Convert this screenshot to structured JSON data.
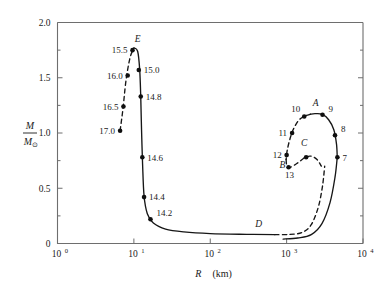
{
  "figure": {
    "kind": "mass-radius-diagram",
    "background": "#ffffff",
    "ink_color": "#161616",
    "axis_color": "#6e6e6e"
  },
  "axes": {
    "y_label_numerator": "M",
    "y_label_denominator": "M",
    "y_label_denominator_sub": "⊙",
    "x_label_symbol": "R",
    "x_label_units": "(km)",
    "y_ticks": [
      "0",
      "0.5",
      "1.0",
      "1.5",
      "2.0"
    ],
    "y_tick_values": [
      0,
      0.5,
      1.0,
      1.5,
      2.0
    ],
    "y_minor_tick_values": [
      0.25,
      0.75,
      1.25,
      1.75
    ],
    "x_ticks": [
      {
        "mantissa": "10",
        "exponent": "0"
      },
      {
        "mantissa": "10",
        "exponent": "1"
      },
      {
        "mantissa": "10",
        "exponent": "2"
      },
      {
        "mantissa": "10",
        "exponent": "3"
      },
      {
        "mantissa": "10",
        "exponent": "4"
      }
    ],
    "x_tick_values": [
      1,
      10,
      100,
      1000,
      10000
    ]
  },
  "chart_data": {
    "type": "line",
    "title": "",
    "xlabel": "R (km)",
    "ylabel": "M / M⊙",
    "xscale": "log",
    "yscale": "linear",
    "xlim": [
      1,
      10000
    ],
    "ylim": [
      0,
      2.0
    ],
    "grid": false,
    "legend": null,
    "series": [
      {
        "name": "white-dwarf-branch-unstable",
        "style": "dashed",
        "points": [
          {
            "x": 6.6,
            "y": 1.02
          },
          {
            "x": 7.2,
            "y": 1.22
          },
          {
            "x": 7.9,
            "y": 1.48
          },
          {
            "x": 8.9,
            "y": 1.68
          },
          {
            "x": 10.0,
            "y": 1.77
          }
        ]
      },
      {
        "name": "white-dwarf-branch-stable",
        "style": "solid",
        "points": [
          {
            "x": 10.0,
            "y": 1.77
          },
          {
            "x": 11.2,
            "y": 1.74
          },
          {
            "x": 11.9,
            "y": 1.58
          },
          {
            "x": 12.3,
            "y": 1.33
          },
          {
            "x": 12.6,
            "y": 1.03
          },
          {
            "x": 13.0,
            "y": 0.72
          },
          {
            "x": 13.6,
            "y": 0.43
          },
          {
            "x": 15.0,
            "y": 0.27
          },
          {
            "x": 18.0,
            "y": 0.185
          },
          {
            "x": 26.0,
            "y": 0.13
          },
          {
            "x": 45.0,
            "y": 0.105
          },
          {
            "x": 100.0,
            "y": 0.09
          },
          {
            "x": 300.0,
            "y": 0.083
          },
          {
            "x": 700.0,
            "y": 0.08
          }
        ]
      },
      {
        "name": "lower-dashed-branch-D",
        "style": "dashed",
        "points": [
          {
            "x": 700.0,
            "y": 0.08
          },
          {
            "x": 1100.0,
            "y": 0.082
          },
          {
            "x": 1600.0,
            "y": 0.1
          },
          {
            "x": 2100.0,
            "y": 0.17
          },
          {
            "x": 2600.0,
            "y": 0.33
          },
          {
            "x": 2950.0,
            "y": 0.52
          },
          {
            "x": 3150.0,
            "y": 0.7
          }
        ]
      },
      {
        "name": "lower-solid-branch-to-7",
        "style": "solid",
        "points": [
          {
            "x": 900.0,
            "y": 0.04
          },
          {
            "x": 1400.0,
            "y": 0.05
          },
          {
            "x": 2100.0,
            "y": 0.08
          },
          {
            "x": 2900.0,
            "y": 0.18
          },
          {
            "x": 3700.0,
            "y": 0.37
          },
          {
            "x": 4300.0,
            "y": 0.6
          },
          {
            "x": 4600.0,
            "y": 0.78
          }
        ]
      },
      {
        "name": "upper-solid-branch-7-8-9",
        "style": "solid",
        "points": [
          {
            "x": 4600.0,
            "y": 0.78
          },
          {
            "x": 4500.0,
            "y": 0.9
          },
          {
            "x": 4150.0,
            "y": 1.03
          },
          {
            "x": 3550.0,
            "y": 1.12
          },
          {
            "x": 2900.0,
            "y": 1.17
          },
          {
            "x": 2350.0,
            "y": 1.175
          },
          {
            "x": 2050.0,
            "y": 1.17
          }
        ]
      },
      {
        "name": "upper-dashed-branch-A-10-11-12",
        "style": "dashed",
        "points": [
          {
            "x": 2050.0,
            "y": 1.17
          },
          {
            "x": 1700.0,
            "y": 1.15
          },
          {
            "x": 1420.0,
            "y": 1.11
          },
          {
            "x": 1200.0,
            "y": 1.02
          },
          {
            "x": 1080.0,
            "y": 0.92
          },
          {
            "x": 1010.0,
            "y": 0.83
          },
          {
            "x": 985.0,
            "y": 0.76
          }
        ]
      },
      {
        "name": "inner-dashed-branch-B-13-C",
        "style": "dashed",
        "points": [
          {
            "x": 985.0,
            "y": 0.76
          },
          {
            "x": 1010.0,
            "y": 0.7
          },
          {
            "x": 1120.0,
            "y": 0.69
          },
          {
            "x": 1400.0,
            "y": 0.73
          },
          {
            "x": 1750.0,
            "y": 0.78
          },
          {
            "x": 2100.0,
            "y": 0.79
          },
          {
            "x": 2500.0,
            "y": 0.76
          },
          {
            "x": 2850.0,
            "y": 0.7
          }
        ]
      }
    ],
    "markers": [
      {
        "label": "17.0",
        "x": 6.6,
        "y": 1.02,
        "label_pos": "left"
      },
      {
        "label": "16.5",
        "x": 7.3,
        "y": 1.24,
        "label_pos": "left"
      },
      {
        "label": "16.0",
        "x": 8.3,
        "y": 1.52,
        "label_pos": "left"
      },
      {
        "label": "15.5",
        "x": 9.6,
        "y": 1.75,
        "label_pos": "left"
      },
      {
        "label": "15.0",
        "x": 11.6,
        "y": 1.57,
        "label_pos": "right"
      },
      {
        "label": "14.8",
        "x": 12.3,
        "y": 1.33,
        "label_pos": "right"
      },
      {
        "label": "14.6",
        "x": 12.9,
        "y": 0.78,
        "label_pos": "right"
      },
      {
        "label": "14.4",
        "x": 13.6,
        "y": 0.42,
        "label_pos": "right"
      },
      {
        "label": "14.2",
        "x": 16.5,
        "y": 0.22,
        "label_pos": "right-up"
      },
      {
        "label": "7",
        "x": 4620.0,
        "y": 0.78,
        "label_pos": "right"
      },
      {
        "label": "8",
        "x": 4300.0,
        "y": 0.98,
        "label_pos": "right-up"
      },
      {
        "label": "9",
        "x": 2950.0,
        "y": 1.165,
        "label_pos": "right-up"
      },
      {
        "label": "10",
        "x": 1700.0,
        "y": 1.15,
        "label_pos": "left-up"
      },
      {
        "label": "11",
        "x": 1180.0,
        "y": 1.0,
        "label_pos": "left"
      },
      {
        "label": "12",
        "x": 1000.0,
        "y": 0.8,
        "label_pos": "left"
      },
      {
        "label": "13",
        "x": 1060.0,
        "y": 0.69,
        "label_pos": "below"
      },
      {
        "label": "C-marker",
        "x": 1800.0,
        "y": 0.78,
        "label_pos": "none"
      }
    ],
    "annotations": [
      {
        "text": "E",
        "x": 11.2,
        "y": 1.82,
        "italic": true
      },
      {
        "text": "A",
        "x": 2400.0,
        "y": 1.24,
        "italic": true
      },
      {
        "text": "B",
        "x": 880.0,
        "y": 0.68,
        "italic": true
      },
      {
        "text": "C",
        "x": 1700.0,
        "y": 0.88,
        "italic": true
      },
      {
        "text": "D",
        "x": 430.0,
        "y": 0.15,
        "italic": true
      }
    ]
  }
}
